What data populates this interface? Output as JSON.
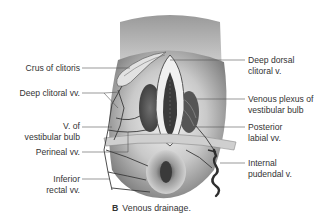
{
  "figure": {
    "caption_letter": "B",
    "caption_text": "Venous drainage.",
    "left_labels": [
      {
        "id": "crus-of-clitoris",
        "lines": [
          "Crus of clitoris"
        ]
      },
      {
        "id": "deep-clitoral-vv",
        "lines": [
          "Deep clitoral vv."
        ]
      },
      {
        "id": "v-of-vestibular-bulb",
        "lines": [
          "V. of",
          "vestibular bulb"
        ]
      },
      {
        "id": "perineal-vv",
        "lines": [
          "Perineal vv."
        ]
      },
      {
        "id": "inferior-rectal-vv",
        "lines": [
          "Inferior",
          "rectal vv."
        ]
      }
    ],
    "right_labels": [
      {
        "id": "deep-dorsal-clitoral-v",
        "lines": [
          "Deep dorsal",
          "clitoral v."
        ]
      },
      {
        "id": "venous-plexus-of-vestibular-bulb",
        "lines": [
          "Venous plexus of",
          "vestibular bulb"
        ]
      },
      {
        "id": "posterior-labial-vv",
        "lines": [
          "Posterior",
          "labial vv."
        ]
      },
      {
        "id": "internal-pudendal-v",
        "lines": [
          "Internal",
          "pudendal v."
        ]
      }
    ],
    "colors": {
      "text": "#333333",
      "leader_line": "#555555",
      "skin_shade": "#8a8a8a",
      "vessel": "#3a3a3a"
    }
  }
}
